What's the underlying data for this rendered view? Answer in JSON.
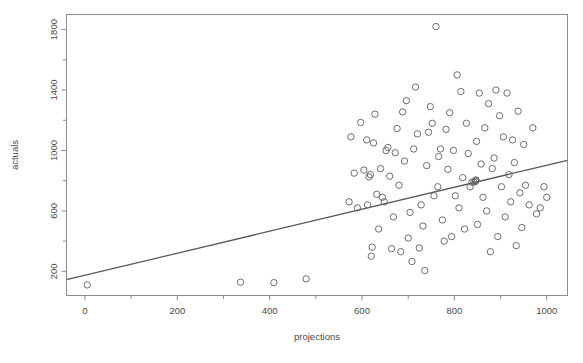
{
  "figure": {
    "name": "scatter-plot-actuals-vs-projections",
    "background_color": "#ffffff",
    "frame_color": "#8d8d8d",
    "point_color": "#5d5d5d",
    "line_color": "#575757",
    "top_clipped_text": ""
  },
  "chart_data": {
    "type": "scatter",
    "title": "",
    "subtitle": "",
    "xlabel": "projections",
    "ylabel": "actuals",
    "xlim": [
      -40,
      1045
    ],
    "ylim": [
      40,
      1900
    ],
    "grid": false,
    "legend": null,
    "legend_position": "none",
    "x_ticks": [
      0,
      200,
      400,
      600,
      800,
      1000
    ],
    "x_tick_labels": [
      "0",
      "200",
      "400",
      "600",
      "800",
      "1000"
    ],
    "x_minor_ticks": [
      100,
      300,
      500,
      700,
      900
    ],
    "y_ticks": [
      200,
      600,
      1000,
      1400,
      1800
    ],
    "y_tick_labels": [
      "200",
      "600",
      "1000",
      "1400",
      "1800"
    ],
    "y_minor_ticks": [
      400,
      800,
      1200,
      1600
    ],
    "marker": "open-circle",
    "marker_size": 3.2,
    "annotations": [],
    "series": [
      {
        "name": "actuals",
        "x": [
          5,
          337,
          409,
          479,
          572,
          576,
          583,
          590,
          597,
          604,
          610,
          612,
          615,
          618,
          620,
          622,
          625,
          628,
          632,
          636,
          640,
          644,
          648,
          652,
          656,
          660,
          664,
          668,
          672,
          676,
          680,
          684,
          688,
          692,
          696,
          700,
          704,
          708,
          712,
          716,
          720,
          724,
          728,
          732,
          736,
          740,
          744,
          748,
          752,
          756,
          760,
          764,
          766,
          770,
          774,
          778,
          782,
          786,
          790,
          794,
          798,
          802,
          806,
          810,
          814,
          818,
          822,
          826,
          830,
          834,
          838,
          842,
          846,
          846,
          847,
          848,
          850,
          854,
          858,
          862,
          866,
          870,
          874,
          878,
          882,
          886,
          890,
          894,
          898,
          902,
          906,
          910,
          914,
          918,
          922,
          926,
          930,
          934,
          938,
          942,
          946,
          950,
          954,
          962,
          970,
          978,
          986,
          994,
          1000
        ],
        "y": [
          110,
          128,
          125,
          150,
          660,
          1090,
          850,
          620,
          1185,
          870,
          1070,
          640,
          825,
          840,
          300,
          360,
          1050,
          1240,
          710,
          480,
          880,
          690,
          660,
          1000,
          1020,
          830,
          350,
          560,
          985,
          1145,
          770,
          330,
          1255,
          930,
          1330,
          420,
          590,
          265,
          1010,
          1420,
          1110,
          355,
          640,
          500,
          205,
          900,
          1120,
          1290,
          1180,
          700,
          1820,
          760,
          960,
          1010,
          540,
          400,
          1140,
          875,
          1250,
          430,
          1000,
          700,
          1500,
          620,
          1390,
          820,
          480,
          1180,
          980,
          760,
          790,
          790,
          800,
          795,
          805,
          1060,
          510,
          1380,
          910,
          690,
          1150,
          600,
          1310,
          330,
          880,
          950,
          1400,
          430,
          1230,
          760,
          1090,
          560,
          1380,
          840,
          660,
          1070,
          920,
          370,
          1260,
          720,
          490,
          1040,
          770,
          640,
          1150,
          580,
          620,
          760,
          690
        ]
      }
    ],
    "fit_line": {
      "name": "regression-line",
      "type": "linear",
      "x_start": -40,
      "y_start": 145,
      "x_end": 1045,
      "y_end": 935
    }
  }
}
